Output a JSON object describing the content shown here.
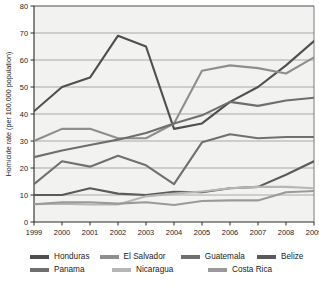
{
  "chart_data": {
    "type": "line",
    "title": "",
    "xlabel": "",
    "ylabel": "Homicide rate (per 100,000 population)",
    "categories": [
      "1999",
      "2000",
      "2001",
      "2002",
      "2003",
      "2004",
      "2005",
      "2006",
      "2007",
      "2008",
      "2009"
    ],
    "x": [
      1999,
      2000,
      2001,
      2002,
      2003,
      2004,
      2005,
      2006,
      2007,
      2008,
      2009
    ],
    "ylim": [
      0,
      80
    ],
    "xlim": [
      1999,
      2009
    ],
    "ytick_values": [
      0,
      10,
      20,
      30,
      40,
      50,
      60,
      70,
      80
    ],
    "ytick_labels": [
      "0",
      "10",
      "20",
      "30",
      "40",
      "50",
      "60",
      "70",
      "80"
    ],
    "grid": true,
    "grid_axis": "y",
    "legend_position": "bottom",
    "legend_columns": 4,
    "series": [
      {
        "name": "Honduras",
        "color": "#4f4f4f",
        "values": [
          41,
          50,
          53.5,
          69,
          65,
          34.5,
          36.5,
          44.5,
          50,
          58,
          67
        ]
      },
      {
        "name": "El Salvador",
        "color": "#8e8e8e",
        "values": [
          30,
          34.5,
          34.5,
          31,
          31,
          36.5,
          56,
          58,
          57,
          55,
          61
        ]
      },
      {
        "name": "Guatemala",
        "color": "#6e6e6e",
        "values": [
          24,
          26.5,
          28.5,
          30.5,
          33,
          36.5,
          39.5,
          44.5,
          43,
          45,
          46
        ]
      },
      {
        "name": "Belize",
        "color": "#5a5a5a",
        "values": [
          10,
          10,
          12.5,
          10.5,
          10,
          11.2,
          11,
          12.5,
          13,
          17.5,
          22.5
        ]
      },
      {
        "name": "Panama",
        "color": "#707070",
        "values": [
          14,
          22.5,
          20.5,
          24.5,
          21,
          14,
          29.5,
          32.5,
          31,
          31.5,
          31.5
        ]
      },
      {
        "name": "Nicaragua",
        "color": "#b6b6b6",
        "values": [
          6.6,
          6.8,
          6.5,
          6.5,
          9.5,
          10.5,
          11.3,
          12.5,
          13,
          13,
          12.5
        ]
      },
      {
        "name": "Costa Rica",
        "color": "#9a9a9a",
        "values": [
          6.6,
          7.3,
          7.3,
          6.8,
          7.3,
          6.3,
          7.8,
          8,
          8,
          11,
          11.5
        ]
      }
    ]
  },
  "legend": {
    "items": [
      {
        "label": "Honduras"
      },
      {
        "label": "El Salvador"
      },
      {
        "label": "Guatemala"
      },
      {
        "label": "Belize"
      },
      {
        "label": "Panama"
      },
      {
        "label": "Nicaragua"
      },
      {
        "label": "Costa Rica"
      }
    ]
  },
  "axis": {
    "y_title": "Homicide rate (per 100,000 population)"
  }
}
